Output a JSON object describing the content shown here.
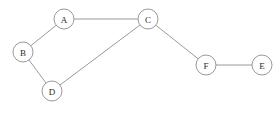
{
  "diagram": {
    "width": 278,
    "height": 113,
    "background_color": "#ffffff",
    "node_fill_color": "#ffffff",
    "node_stroke_color": "#9a9a9a",
    "edge_color": "#9a9a9a",
    "label_color": "#2b2b2b",
    "node_radius": 10,
    "nodes": [
      {
        "id": "A",
        "label": "A",
        "x": 64,
        "y": 19
      },
      {
        "id": "B",
        "label": "B",
        "x": 23,
        "y": 52
      },
      {
        "id": "C",
        "label": "C",
        "x": 148,
        "y": 19
      },
      {
        "id": "D",
        "label": "D",
        "x": 52,
        "y": 91
      },
      {
        "id": "E",
        "label": "E",
        "x": 262,
        "y": 65
      },
      {
        "id": "F",
        "label": "F",
        "x": 206,
        "y": 65
      }
    ],
    "edges": [
      {
        "id": "A-B",
        "source": "A",
        "target": "B"
      },
      {
        "id": "A-C",
        "source": "A",
        "target": "C"
      },
      {
        "id": "B-D",
        "source": "B",
        "target": "D"
      },
      {
        "id": "C-D",
        "source": "C",
        "target": "D"
      },
      {
        "id": "C-F",
        "source": "C",
        "target": "F"
      },
      {
        "id": "E-F",
        "source": "F",
        "target": "E"
      }
    ]
  }
}
